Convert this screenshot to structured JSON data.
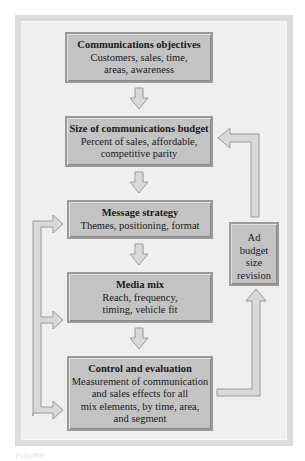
{
  "diagram": {
    "steps": [
      {
        "title": "Communications objectives",
        "body": "Customers, sales, time,\nareas, awareness"
      },
      {
        "title": "Size of communications budget",
        "body": "Percent of sales, affordable,\ncompetitive parity"
      },
      {
        "title": "Message strategy",
        "body": "Themes, positioning, format"
      },
      {
        "title": "Media mix",
        "body": "Reach, frequency,\ntiming, vehicle fit"
      },
      {
        "title": "Control and evaluation",
        "body": "Measurement of communication\nand sales effects for all\nmix elements, by time, area,\nand segment"
      }
    ],
    "feedback_box": {
      "label": "Ad\nbudget\nsize\nrevision"
    },
    "connections": [
      {
        "from": "Communications objectives",
        "to": "Size of communications budget",
        "type": "down-arrow"
      },
      {
        "from": "Size of communications budget",
        "to": "Message strategy",
        "type": "down-arrow"
      },
      {
        "from": "Message strategy",
        "to": "Media mix",
        "type": "down-arrow"
      },
      {
        "from": "Media mix",
        "to": "Control and evaluation",
        "type": "down-arrow"
      },
      {
        "from": "Control and evaluation",
        "to": "Ad budget size revision",
        "type": "feedback-right-up"
      },
      {
        "from": "Ad budget size revision",
        "to": "Size of communications budget",
        "type": "feedback-up-left"
      },
      {
        "from": "Left loop",
        "to": [
          "Message strategy",
          "Media mix",
          "Control and evaluation"
        ],
        "type": "left-feedback-loop"
      }
    ],
    "colors": {
      "box_fill": "#c3c3c3",
      "box_border": "#9a9a9a",
      "panel": "#efefef",
      "frame": "#dcdcdc",
      "arrow_fill": "#d8d8d8",
      "arrow_stroke": "#9a9a9a"
    }
  },
  "caption": "FIGURE"
}
